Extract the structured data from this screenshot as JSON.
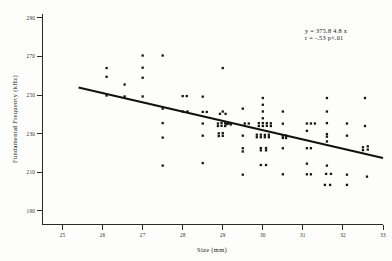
{
  "chart_data": {
    "type": "scatter",
    "title": "",
    "xlabel": "Size (mm)",
    "ylabel": "Fundamental Frequency  (kHz)",
    "xlim": [
      24.5,
      33.0
    ],
    "ylim": [
      183,
      292
    ],
    "xticks": [
      25,
      26,
      27,
      28,
      29,
      30,
      31,
      32,
      33
    ],
    "yticks": [
      190,
      210,
      230,
      250,
      270,
      290
    ],
    "xtick_labels": [
      "25",
      "26",
      "27",
      "28",
      "29",
      "30",
      "31",
      "32",
      "33"
    ],
    "ytick_labels": [
      "190",
      "210",
      "230",
      "250",
      "270",
      "290"
    ],
    "grid": false,
    "legend": false,
    "marker": "square-dot",
    "marker_color": "#141414",
    "annotations": [
      {
        "name": "regression-equation",
        "text": "y = 375.8  4.8 x",
        "x": 31.55,
        "y": 286
      },
      {
        "name": "correlation-stats",
        "text": "r = -.53  p<.01",
        "x": 31.55,
        "y": 281
      }
    ],
    "fit_line": {
      "type": "linear",
      "intercept": 375.8,
      "slope": -4.8,
      "x_start": 25.4,
      "x_end": 33.0,
      "y_start": 253.9,
      "y_end": 217.4
    },
    "points": [
      [
        26.1,
        264.0
      ],
      [
        26.1,
        259.5
      ],
      [
        26.1,
        249.8
      ],
      [
        26.55,
        255.5
      ],
      [
        26.55,
        249.3
      ],
      [
        27.0,
        270.5
      ],
      [
        27.0,
        264.2
      ],
      [
        27.0,
        259.0
      ],
      [
        27.0,
        249.3
      ],
      [
        27.5,
        270.5
      ],
      [
        27.5,
        243.0
      ],
      [
        27.5,
        235.5
      ],
      [
        27.5,
        228.0
      ],
      [
        27.5,
        213.5
      ],
      [
        28.0,
        249.5
      ],
      [
        28.1,
        249.5
      ],
      [
        28.0,
        241.5
      ],
      [
        28.12,
        241.5
      ],
      [
        28.5,
        249.2
      ],
      [
        28.5,
        241.3
      ],
      [
        28.6,
        241.3
      ],
      [
        28.5,
        235.3
      ],
      [
        28.5,
        229.0
      ],
      [
        28.5,
        214.8
      ],
      [
        29.0,
        264.0
      ],
      [
        29.0,
        241.5
      ],
      [
        28.93,
        240.3
      ],
      [
        29.07,
        240.3
      ],
      [
        28.88,
        235.3
      ],
      [
        28.97,
        235.5
      ],
      [
        29.06,
        235.4
      ],
      [
        29.15,
        235.3
      ],
      [
        28.88,
        234.0
      ],
      [
        28.97,
        234.1
      ],
      [
        29.06,
        234.0
      ],
      [
        28.9,
        230.2
      ],
      [
        29.0,
        230.3
      ],
      [
        28.9,
        228.8
      ],
      [
        29.0,
        228.9
      ],
      [
        29.1,
        235.0
      ],
      [
        29.2,
        234.8
      ],
      [
        29.5,
        243.0
      ],
      [
        29.55,
        235.3
      ],
      [
        29.65,
        235.3
      ],
      [
        29.5,
        229.0
      ],
      [
        29.5,
        222.5
      ],
      [
        29.5,
        220.8
      ],
      [
        29.5,
        208.8
      ],
      [
        30.0,
        248.5
      ],
      [
        30.0,
        245.0
      ],
      [
        30.0,
        241.5
      ],
      [
        30.0,
        238.0
      ],
      [
        29.9,
        235.5
      ],
      [
        30.0,
        235.5
      ],
      [
        30.1,
        235.5
      ],
      [
        30.2,
        235.4
      ],
      [
        29.9,
        234.0
      ],
      [
        30.0,
        234.0
      ],
      [
        30.1,
        234.1
      ],
      [
        30.2,
        234.0
      ],
      [
        29.85,
        229.5
      ],
      [
        29.95,
        229.5
      ],
      [
        30.05,
        229.4
      ],
      [
        30.15,
        229.5
      ],
      [
        29.85,
        228.2
      ],
      [
        29.95,
        228.2
      ],
      [
        30.05,
        228.2
      ],
      [
        30.15,
        228.2
      ],
      [
        29.95,
        222.6
      ],
      [
        30.08,
        222.6
      ],
      [
        29.95,
        221.4
      ],
      [
        30.08,
        221.4
      ],
      [
        29.95,
        213.8
      ],
      [
        30.08,
        213.8
      ],
      [
        30.5,
        241.5
      ],
      [
        30.5,
        235.2
      ],
      [
        30.5,
        229.0
      ],
      [
        30.58,
        229.0
      ],
      [
        30.5,
        227.8
      ],
      [
        30.58,
        227.8
      ],
      [
        30.5,
        222.5
      ],
      [
        30.5,
        209.0
      ],
      [
        31.1,
        235.3
      ],
      [
        31.2,
        235.3
      ],
      [
        31.3,
        235.3
      ],
      [
        31.1,
        231.5
      ],
      [
        31.1,
        222.5
      ],
      [
        31.2,
        222.5
      ],
      [
        31.1,
        214.5
      ],
      [
        31.1,
        209.0
      ],
      [
        31.2,
        209.0
      ],
      [
        31.6,
        248.5
      ],
      [
        31.6,
        241.5
      ],
      [
        31.6,
        235.5
      ],
      [
        31.6,
        229.8
      ],
      [
        31.6,
        228.5
      ],
      [
        31.6,
        226.0
      ],
      [
        31.6,
        213.5
      ],
      [
        31.58,
        209.2
      ],
      [
        31.7,
        209.2
      ],
      [
        31.55,
        203.5
      ],
      [
        31.68,
        203.5
      ],
      [
        32.1,
        235.3
      ],
      [
        32.1,
        229.0
      ],
      [
        32.1,
        208.8
      ],
      [
        32.1,
        203.5
      ],
      [
        32.55,
        248.5
      ],
      [
        32.55,
        234.0
      ],
      [
        32.5,
        223.0
      ],
      [
        32.62,
        223.5
      ],
      [
        32.5,
        221.5
      ],
      [
        32.62,
        221.8
      ],
      [
        32.6,
        207.8
      ]
    ]
  },
  "figure": {
    "background": "#fdfdfb",
    "axis_color": "#2a2a2a",
    "line_color": "#111111",
    "point_color": "#141414"
  }
}
